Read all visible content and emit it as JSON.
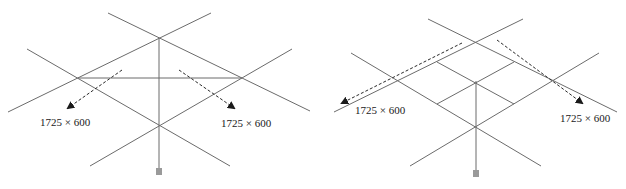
{
  "figure": {
    "panels": [
      {
        "id": "left",
        "annotations": [
          {
            "text": "1725 × 600",
            "x": 40,
            "y": 126
          },
          {
            "text": "1725 × 600",
            "x": 221,
            "y": 127
          }
        ]
      },
      {
        "id": "right",
        "annotations": [
          {
            "text": "1725 × 600",
            "x": 355,
            "y": 114
          },
          {
            "text": "1725 × 600",
            "x": 560,
            "y": 122
          }
        ]
      }
    ],
    "colors": {
      "lines": "#6b6b6b",
      "arrows": "#2a2a2a",
      "text": "#1a1a1a"
    }
  }
}
